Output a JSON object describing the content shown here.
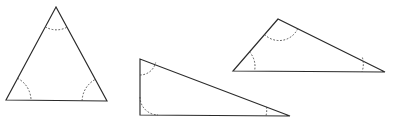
{
  "figure": {
    "background_color": "#ffffff",
    "stroke_color": "#2a2a2a",
    "arc_color": "#4a4a4a",
    "canvas": {
      "width": 395,
      "height": 121
    },
    "shapes": [
      {
        "name": "triangle-equilateral",
        "label": "Triangle 1",
        "vertices": [
          {
            "name": "apex",
            "x": 56,
            "y": 7
          },
          {
            "name": "bottom-left",
            "x": 6,
            "y": 100
          },
          {
            "name": "bottom-right",
            "x": 107,
            "y": 101
          }
        ],
        "path": "M 56 7 L 6 100 L 107 101 Z",
        "arcs": [
          {
            "name": "angle-arc-apex",
            "d": "M 45.3 26.9 A 22.5 22.5 0 0 0 67.2 27.1"
          },
          {
            "name": "angle-arc-bottom-left",
            "d": "M 17.6 78.3 A 25.0 25.0 0 0 1 31.0 99.6"
          },
          {
            "name": "angle-arc-bottom-right",
            "d": "M 82.1 100.8 A 25.0 25.0 0 0 1 95.5 79.3"
          }
        ]
      },
      {
        "name": "triangle-right-wide",
        "label": "Triangle 2",
        "vertices": [
          {
            "name": "top-left",
            "x": 140,
            "y": 59
          },
          {
            "name": "bottom-left",
            "x": 140,
            "y": 115
          },
          {
            "name": "right-tip",
            "x": 290,
            "y": 116
          }
        ],
        "path": "M 140 59 L 140 115 L 290 116 Z",
        "arcs": [
          {
            "name": "angle-arc-top-left",
            "d": "M 140 75.0 A 16.0 16.0 0 0 0 155.6 62.6"
          },
          {
            "name": "angle-arc-bottom-left",
            "d": "M 140 97.0 A 18.0 18.0 0 0 0 158.0 114.9"
          },
          {
            "name": "angle-arc-right-tip",
            "d": "M 266.5 106.9 A 24.0 24.0 0 0 1 266.0 115.8"
          }
        ]
      },
      {
        "name": "triangle-scalene-obtuse",
        "label": "Triangle 3",
        "vertices": [
          {
            "name": "apex",
            "x": 278,
            "y": 19
          },
          {
            "name": "left",
            "x": 233,
            "y": 71
          },
          {
            "name": "right",
            "x": 385,
            "y": 72
          }
        ],
        "path": "M 278 19 L 233 71 L 385 72 Z",
        "arcs": [
          {
            "name": "angle-arc-apex",
            "d": "M 264.6 34.5 A 20.5 20.5 0 0 0 298.3 27.3"
          },
          {
            "name": "angle-arc-left",
            "d": "M 249.5 51.9 A 21.5 21.5 0 0 1 254.5 70.9"
          },
          {
            "name": "angle-arc-right",
            "d": "M 362.4 57.6 A 23.0 23.0 0 0 1 362.0 71.8"
          }
        ]
      }
    ]
  }
}
